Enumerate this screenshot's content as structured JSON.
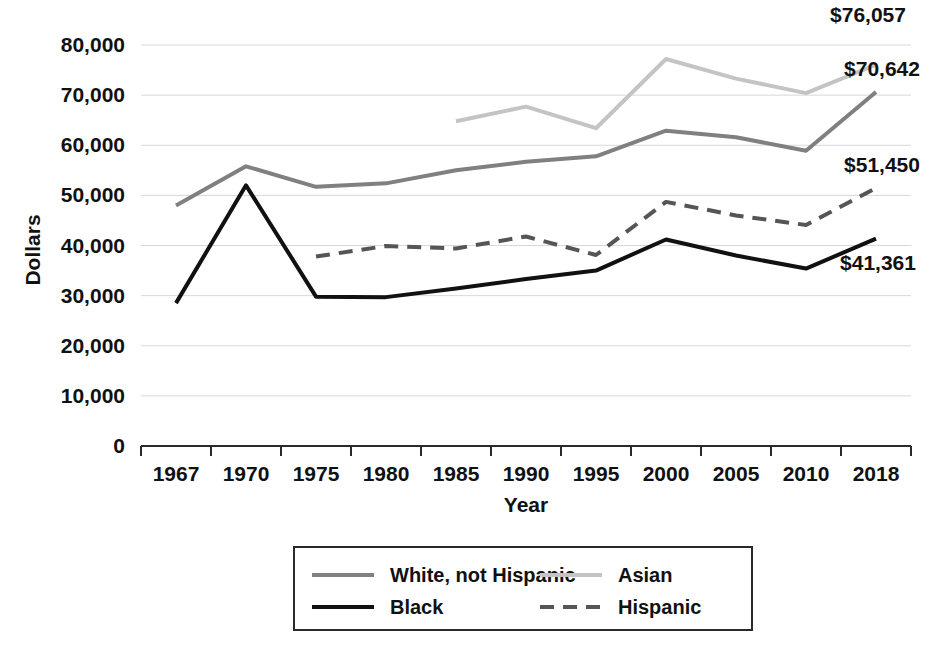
{
  "chart_data": {
    "type": "line",
    "title": "",
    "xlabel": "Year",
    "ylabel": "Dollars",
    "categories": [
      "1967",
      "1970",
      "1975",
      "1980",
      "1985",
      "1990",
      "1995",
      "2000",
      "2005",
      "2010",
      "2018"
    ],
    "ylim": [
      0,
      80000
    ],
    "yticks": [
      0,
      10000,
      20000,
      30000,
      40000,
      50000,
      60000,
      70000,
      80000
    ],
    "ytick_labels": [
      "0",
      "10,000",
      "20,000",
      "30,000",
      "40,000",
      "50,000",
      "60,000",
      "70,000",
      "80,000"
    ],
    "grid": true,
    "legend_position": "bottom",
    "series": [
      {
        "name": "White, not Hispanic",
        "color": "#808080",
        "style": "solid",
        "width": 4,
        "values": [
          48000,
          55800,
          51700,
          52400,
          55000,
          56700,
          57800,
          62900,
          61600,
          58900,
          70642
        ]
      },
      {
        "name": "Asian",
        "color": "#c4c4c4",
        "style": "solid",
        "width": 4,
        "values": [
          null,
          null,
          null,
          null,
          64800,
          67700,
          63400,
          77200,
          73300,
          70400,
          76057
        ]
      },
      {
        "name": "Black",
        "color": "#111111",
        "style": "solid",
        "width": 4,
        "values": [
          28500,
          52000,
          29800,
          29700,
          31400,
          33300,
          35000,
          41200,
          38000,
          35400,
          41361
        ]
      },
      {
        "name": "Hispanic",
        "color": "#555555",
        "style": "dashed",
        "width": 4,
        "values": [
          null,
          null,
          37800,
          39900,
          39400,
          41800,
          38100,
          48700,
          46000,
          44100,
          51450
        ]
      }
    ],
    "annotations": [
      {
        "text": "$76,057",
        "series": "Asian",
        "value": 76057,
        "x": 868,
        "y": 22
      },
      {
        "text": "$70,642",
        "series": "White, not Hispanic",
        "value": 70642,
        "x": 882,
        "y": 76
      },
      {
        "text": "$51,450",
        "series": "Hispanic",
        "value": 51450,
        "x": 882,
        "y": 172
      },
      {
        "text": "$41,361",
        "series": "Black",
        "value": 41361,
        "x": 878,
        "y": 270
      }
    ]
  },
  "legend": {
    "entries": [
      {
        "label": "White, not Hispanic",
        "color": "#808080",
        "style": "solid"
      },
      {
        "label": "Asian",
        "color": "#c4c4c4",
        "style": "solid"
      },
      {
        "label": "Black",
        "color": "#111111",
        "style": "solid"
      },
      {
        "label": "Hispanic",
        "color": "#555555",
        "style": "dashed"
      }
    ]
  },
  "axes": {
    "y_title": "Dollars",
    "x_title": "Year"
  }
}
